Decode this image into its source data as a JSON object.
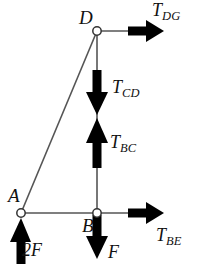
{
  "diagram": {
    "type": "free-body-diagram",
    "background_color": "#ffffff",
    "member_color": "#555555",
    "arrow_color": "#000000",
    "node_fill": "#ffffff",
    "node_stroke": "#333333",
    "nodes": [
      {
        "id": "D",
        "label": "D",
        "x": 97,
        "y": 31,
        "marker": "open-circle"
      },
      {
        "id": "A",
        "label": "A",
        "x": 21,
        "y": 213,
        "marker": "open-circle"
      },
      {
        "id": "B",
        "label": "B",
        "x": 97,
        "y": 213,
        "marker": "open-circle"
      }
    ],
    "members": [
      {
        "id": "DB",
        "from": "D",
        "to": "B",
        "orientation": "vertical"
      },
      {
        "id": "AB",
        "from": "A",
        "to": "B",
        "orientation": "horizontal"
      },
      {
        "id": "AD",
        "from": "A",
        "to": "D",
        "orientation": "diagonal"
      }
    ],
    "forces": [
      {
        "id": "T_DG",
        "symbol": "T",
        "subscript": "DG",
        "label": "T_DG",
        "direction": "right",
        "at_node": "D",
        "arrow_start": {
          "x": 128,
          "y": 31
        },
        "arrow_end": {
          "x": 162,
          "y": 31
        }
      },
      {
        "id": "T_CD",
        "symbol": "T",
        "subscript": "CD",
        "label": "T_CD",
        "direction": "down",
        "on_member": "DB",
        "arrow_start": {
          "x": 97,
          "y": 72
        },
        "arrow_end": {
          "x": 97,
          "y": 114
        }
      },
      {
        "id": "T_BC",
        "symbol": "T",
        "subscript": "BC",
        "label": "T_BC",
        "direction": "up",
        "on_member": "DB",
        "arrow_start": {
          "x": 97,
          "y": 166
        },
        "arrow_end": {
          "x": 97,
          "y": 119
        }
      },
      {
        "id": "T_BE",
        "symbol": "T",
        "subscript": "BE",
        "label": "T_BE",
        "direction": "right",
        "at_node": "B",
        "arrow_start": {
          "x": 128,
          "y": 213
        },
        "arrow_end": {
          "x": 162,
          "y": 213
        }
      },
      {
        "id": "2F",
        "symbol": "2F",
        "subscript": "",
        "label": "2F",
        "direction": "up",
        "at_node": "A",
        "arrow_start": {
          "x": 21,
          "y": 262
        },
        "arrow_end": {
          "x": 21,
          "y": 219
        }
      },
      {
        "id": "F",
        "symbol": "F",
        "subscript": "",
        "label": "F",
        "direction": "down",
        "at_node": "B",
        "arrow_start": {
          "x": 97,
          "y": 217
        },
        "arrow_end": {
          "x": 97,
          "y": 259
        }
      }
    ],
    "labels": {
      "node_D": "D",
      "node_A": "A",
      "node_B": "B",
      "T_DG_symbol": "T",
      "T_DG_sub": "DG",
      "T_CD_symbol": "T",
      "T_CD_sub": "CD",
      "T_BC_symbol": "T",
      "T_BC_sub": "BC",
      "T_BE_symbol": "T",
      "T_BE_sub": "BE",
      "force_2F": "2F",
      "force_F": "F"
    }
  }
}
